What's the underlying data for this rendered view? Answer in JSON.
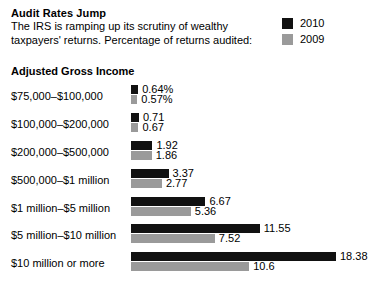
{
  "header": {
    "title": "Audit Rates Jump",
    "subtitle_line1": "The IRS is ramping up its scrutiny of wealthy",
    "subtitle_line2": "taxpayers' returns. Percentage of returns audited:"
  },
  "legend": {
    "items": [
      {
        "label": "2010",
        "color": "#111111"
      },
      {
        "label": "2009",
        "color": "#9a9a9a"
      }
    ]
  },
  "axis_heading": "Adjusted Gross Income",
  "chart_data": {
    "type": "bar",
    "orientation": "horizontal",
    "title": "Audit Rates Jump",
    "subtitle": "The IRS is ramping up its scrutiny of wealthy taxpayers' returns. Percentage of returns audited:",
    "xlabel": "",
    "ylabel": "Adjusted Gross Income",
    "grid": false,
    "legend_position": "top-right",
    "xlim": [
      0,
      18.38
    ],
    "categories": [
      "$75,000–$100,000",
      "$100,000–$200,000",
      "$200,000–$500,000",
      "$500,000–$1 million",
      "$1 million–$5 million",
      "$5 million–$10 million",
      "$10 million or more"
    ],
    "series": [
      {
        "name": "2010",
        "color": "#111111",
        "values": [
          0.64,
          0.71,
          1.92,
          3.37,
          6.67,
          11.55,
          18.38
        ],
        "labels": [
          "0.64%",
          "0.71",
          "1.92",
          "3.37",
          "6.67",
          "11.55",
          "18.38"
        ]
      },
      {
        "name": "2009",
        "color": "#9a9a9a",
        "values": [
          0.57,
          0.67,
          1.86,
          2.77,
          5.36,
          7.52,
          10.6
        ],
        "labels": [
          "0.57%",
          "0.67",
          "1.86",
          "2.77",
          "5.36",
          "7.52",
          "10.6"
        ]
      }
    ]
  }
}
